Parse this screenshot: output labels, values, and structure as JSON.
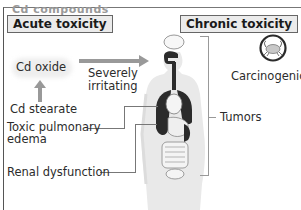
{
  "header_cut": "Cd compounds",
  "sections": {
    "acute": {
      "title": "Acute toxicity"
    },
    "chronic": {
      "title": "Chronic toxicity"
    }
  },
  "labels": {
    "cd_oxide": "Cd oxide",
    "cd_stearate": "Cd stearate",
    "severely": "Severely",
    "irritating": "irritating",
    "carcinogenic": "Carcinogenic",
    "tumors": "Tumors",
    "toxic_pulmonary": "Toxic pulmonary",
    "edema": "edema",
    "renal": "Renal dysfunction"
  },
  "icons": {
    "crab": "crab-icon (cancer symbol)",
    "body": "human-body-organs-figure"
  },
  "colors": {
    "arrow": "#999999",
    "header_bg": "#ebebeb",
    "organs_dark": "#2b2b2b",
    "body_fill": "#e8e8e8"
  }
}
